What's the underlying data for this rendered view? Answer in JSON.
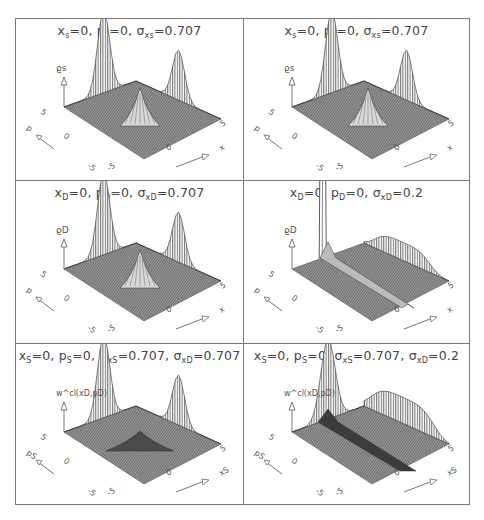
{
  "figure": {
    "layout": {
      "rows": 3,
      "cols": 2
    },
    "panels": [
      {
        "id": "top-left",
        "title_parts": [
          [
            "x",
            "s",
            "=0,  "
          ],
          [
            "p",
            "s",
            "=0,  "
          ],
          [
            "σ",
            "xs",
            "=0.707"
          ]
        ],
        "title_text": "xs=0, ps=0, σxs=0.707",
        "zlabel": "ϱs",
        "ylabel": "p",
        "xlabel": "x",
        "ticks": {
          "y_top": "5",
          "y_mid": "0",
          "y_bot": "-5",
          "x_left": "-5",
          "x_mid": "0",
          "x_right": "5"
        },
        "shape": "gauss-center-plus-wings"
      },
      {
        "id": "top-right",
        "title_parts": [
          [
            "x",
            "s",
            "=0,  "
          ],
          [
            "p",
            "s",
            "=0,  "
          ],
          [
            "σ",
            "xs",
            "=0.707"
          ]
        ],
        "title_text": "xs=0, ps=0, σxs=0.707",
        "zlabel": "ϱs",
        "ylabel": "p",
        "xlabel": "x",
        "ticks": {
          "y_top": "5",
          "y_mid": "0",
          "y_bot": "-5",
          "x_left": "-5",
          "x_mid": "0",
          "x_right": "5"
        },
        "shape": "gauss-center-plus-wings"
      },
      {
        "id": "middle-left",
        "title_parts": [
          [
            "x",
            "D",
            "=0,  "
          ],
          [
            "p",
            "D",
            "=0,  "
          ],
          [
            "σ",
            "xD",
            "=0.707"
          ]
        ],
        "title_text": "xD=0, pD=0, σxD=0.707",
        "zlabel": "ϱD",
        "ylabel": "p",
        "xlabel": "x",
        "ticks": {
          "y_top": "5",
          "y_mid": "0",
          "y_bot": "-5",
          "x_left": "-5",
          "x_mid": "0",
          "x_right": "5"
        },
        "shape": "gauss-center-plus-wings"
      },
      {
        "id": "middle-right",
        "title_parts": [
          [
            "x",
            "D",
            "=0,  "
          ],
          [
            "p",
            "D",
            "=0,  "
          ],
          [
            "σ",
            "xD",
            "=0.2"
          ]
        ],
        "title_text": "xD=0, pD=0, σxD=0.2",
        "zlabel": "ϱD",
        "ylabel": "p",
        "xlabel": "x",
        "ticks": {
          "y_top": "5",
          "y_mid": "0",
          "y_bot": "-5",
          "x_left": "-5",
          "x_mid": "0",
          "x_right": "5"
        },
        "shape": "spike-plus-ridges"
      },
      {
        "id": "bottom-left",
        "title_parts": [
          [
            "x",
            "S",
            "=0,  "
          ],
          [
            "p",
            "S",
            "=0,  "
          ],
          [
            "σ",
            "xS",
            "=0.707,  "
          ],
          [
            "σ",
            "xD",
            "=0.707"
          ]
        ],
        "title_text": "xS=0, pS=0, σxS=0.707, σxD=0.707",
        "zlabel": "w^cl(xD,pD)",
        "ylabel": "pS",
        "xlabel": "xS",
        "ticks": {
          "y_top": "5",
          "y_mid": "0",
          "y_bot": "-5",
          "x_left": "-5",
          "x_mid": "0",
          "x_right": "5"
        },
        "shape": "dip-center-plus-wings"
      },
      {
        "id": "bottom-right",
        "title_parts": [
          [
            "x",
            "S",
            "=0,  "
          ],
          [
            "p",
            "S",
            "=0,  "
          ],
          [
            "σ",
            "xS",
            "=0.707,  "
          ],
          [
            "σ",
            "xD",
            "=0.2"
          ]
        ],
        "title_text": "xS=0, pS=0, σxS=0.707, σxD=0.2",
        "zlabel": "w^cl(xD,pD)",
        "ylabel": "pS",
        "xlabel": "xS",
        "ticks": {
          "y_top": "5",
          "y_mid": "0",
          "y_bot": "-5",
          "x_left": "-5",
          "x_mid": "0",
          "x_right": "5"
        },
        "shape": "ridge-trough"
      }
    ]
  },
  "chart_data": [
    {
      "type": "surface3d",
      "title": "xs=0, ps=0, σxs=0.707",
      "zlabel": "ϱs",
      "xlabel": "x",
      "ylabel": "p",
      "x_range": [
        -5,
        5
      ],
      "y_range": [
        -5,
        5
      ],
      "xticks": [
        "-5",
        "0",
        "5"
      ],
      "yticks": [
        "-5",
        "0",
        "5"
      ],
      "features": "central Gaussian peak at (0,0) with two tall marginal projections on the back walls"
    },
    {
      "type": "surface3d",
      "title": "xs=0, ps=0, σxs=0.707",
      "zlabel": "ϱs",
      "xlabel": "x",
      "ylabel": "p",
      "x_range": [
        -5,
        5
      ],
      "y_range": [
        -5,
        5
      ],
      "xticks": [
        "-5",
        "0",
        "5"
      ],
      "yticks": [
        "-5",
        "0",
        "5"
      ],
      "features": "central Gaussian peak at (0,0) with two tall marginal projections on the back walls"
    },
    {
      "type": "surface3d",
      "title": "xD=0, pD=0, σxD=0.707",
      "zlabel": "ϱD",
      "xlabel": "x",
      "ylabel": "p",
      "x_range": [
        -5,
        5
      ],
      "y_range": [
        -5,
        5
      ],
      "xticks": [
        "-5",
        "0",
        "5"
      ],
      "yticks": [
        "-5",
        "0",
        "5"
      ],
      "features": "central Gaussian peak at (0,0) with two tall marginal projections"
    },
    {
      "type": "surface3d",
      "title": "xD=0, pD=0, σxD=0.2",
      "zlabel": "ϱD",
      "xlabel": "x",
      "ylabel": "p",
      "x_range": [
        -5,
        5
      ],
      "y_range": [
        -5,
        5
      ],
      "xticks": [
        "-5",
        "0",
        "5"
      ],
      "yticks": [
        "-5",
        "0",
        "5"
      ],
      "features": "narrow tall spike in x marginal, broad flat marginal in p, ridge along p axis"
    },
    {
      "type": "surface3d",
      "title": "xS=0, pS=0, σxS=0.707, σxD=0.707",
      "zlabel": "w^cl(xD,pD)",
      "xlabel": "xS",
      "ylabel": "pS",
      "x_range": [
        -5,
        5
      ],
      "y_range": [
        -5,
        5
      ],
      "xticks": [
        "-5",
        "0",
        "5"
      ],
      "yticks": [
        "-5",
        "0",
        "5"
      ],
      "features": "central dip/peak with two marginal projections"
    },
    {
      "type": "surface3d",
      "title": "xS=0, pS=0, σxS=0.707, σxD=0.2",
      "zlabel": "w^cl(xD,pD)",
      "xlabel": "xS",
      "ylabel": "pS",
      "x_range": [
        -5,
        5
      ],
      "y_range": [
        -5,
        5
      ],
      "xticks": [
        "-5",
        "0",
        "5"
      ],
      "yticks": [
        "-5",
        "0",
        "5"
      ],
      "features": "tall Gaussian x-marginal, broad p-marginal, elongated trough along p axis"
    }
  ]
}
